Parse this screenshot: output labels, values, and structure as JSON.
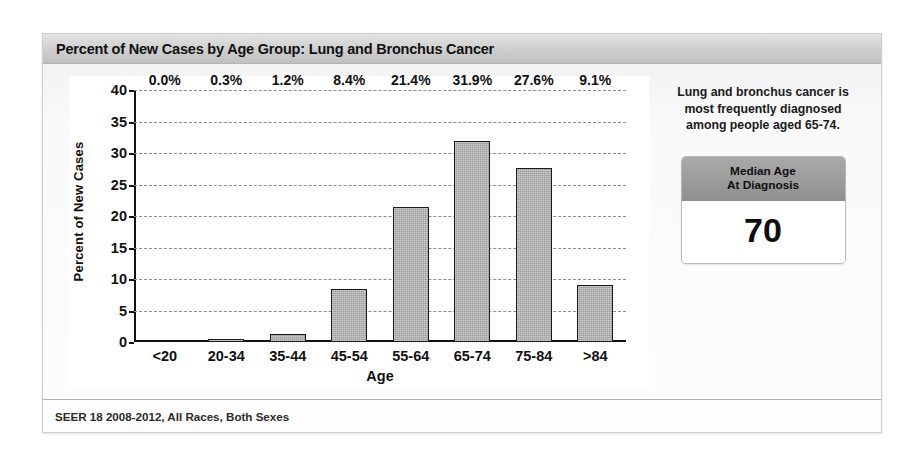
{
  "header": {
    "title": "Percent of New Cases by Age Group: Lung and Bronchus Cancer"
  },
  "footer": {
    "source": "SEER 18 2008-2012, All Races, Both Sexes"
  },
  "side_panel": {
    "caption": "Lung and bronchus cancer is most frequently diagnosed among people aged 65-74.",
    "median_box": {
      "header_line1": "Median Age",
      "header_line2": "At Diagnosis",
      "value": "70"
    }
  },
  "chart_data": {
    "type": "bar",
    "title": "Percent of New Cases by Age Group: Lung and Bronchus Cancer",
    "xlabel": "Age",
    "ylabel": "Percent of New Cases",
    "categories": [
      "<20",
      "20-34",
      "35-44",
      "45-54",
      "55-64",
      "65-74",
      "75-84",
      ">84"
    ],
    "values": [
      0.0,
      0.3,
      1.2,
      8.4,
      21.4,
      31.9,
      27.6,
      9.1
    ],
    "data_labels": [
      "0.0%",
      "0.3%",
      "1.2%",
      "8.4%",
      "21.4%",
      "31.9%",
      "27.6%",
      "9.1%"
    ],
    "ylim": [
      0,
      40
    ],
    "yticks": [
      0,
      5,
      10,
      15,
      20,
      25,
      30,
      35,
      40
    ],
    "ytick_labels": [
      "0",
      "5",
      "10",
      "15",
      "20",
      "25",
      "30",
      "35",
      "40"
    ],
    "grid": true,
    "grid_style": "dashed",
    "legend": "none",
    "bar_color": "#9c9c9c",
    "bar_edge_color": "#1b1b1b"
  }
}
